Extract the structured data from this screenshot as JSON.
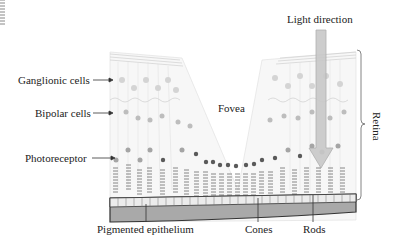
{
  "diagram": {
    "labels": {
      "ganglionic": "Ganglionic cells",
      "bipolar": "Bipolar cells",
      "photoreceptor": "Photoreceptor",
      "fovea": "Fovea",
      "light_direction": "Light direction",
      "retina": "Retina",
      "pigmented_epithelium": "Pigmented epithelium",
      "cones": "Cones",
      "rods": "Rods"
    },
    "colors": {
      "cell_fill": "#cfcfcf",
      "cell_dark": "#555555",
      "layer_line": "#bbbbbb",
      "epithelium_fill": "#a8a8a8",
      "epithelium_border": "#333333",
      "arrow_fill": "#c8c8c8",
      "arrow_stroke": "#aaaaaa"
    }
  }
}
